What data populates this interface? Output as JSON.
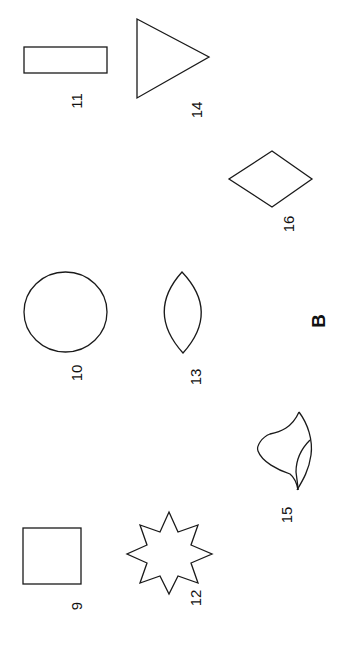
{
  "figure": {
    "panel_letter": "B",
    "orientation": "rotated 90 degrees counter-clockwise",
    "stroke_color": "#1a1a1a",
    "background_color": "#ffffff",
    "shapes": [
      {
        "id": 9,
        "label": "9",
        "type": "square"
      },
      {
        "id": 10,
        "label": "10",
        "type": "circle"
      },
      {
        "id": 11,
        "label": "11",
        "type": "rectangle"
      },
      {
        "id": 12,
        "label": "12",
        "type": "eight-pointed-star"
      },
      {
        "id": 13,
        "label": "13",
        "type": "lens"
      },
      {
        "id": 14,
        "label": "14",
        "type": "triangle"
      },
      {
        "id": 15,
        "label": "15",
        "type": "irregular-leaf-shape"
      },
      {
        "id": 16,
        "label": "16",
        "type": "diamond"
      }
    ]
  }
}
